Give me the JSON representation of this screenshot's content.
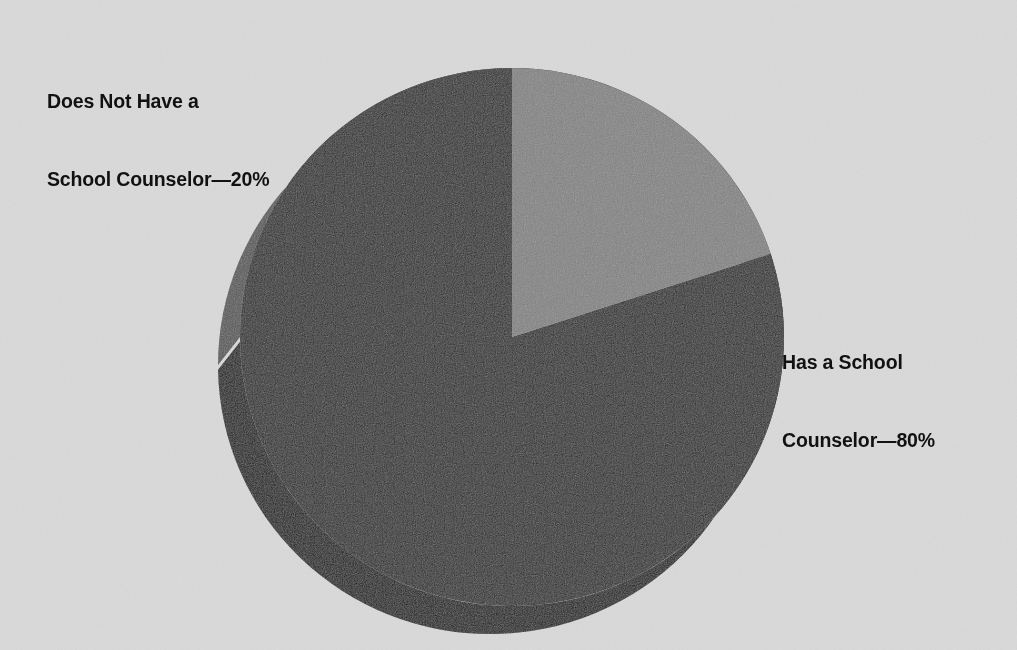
{
  "figure": {
    "background_color": "#dadada",
    "width": 1017,
    "height": 650
  },
  "labels": {
    "left": {
      "name": "does-not-have-counselor-label",
      "line1": "Does Not Have a",
      "line2": "School Counselor—20%",
      "text_color": "#111111"
    },
    "right": {
      "name": "has-counselor-label",
      "line1": "Has a School",
      "line2": "Counselor—80%",
      "text_color": "#111111"
    }
  },
  "chart_data": {
    "type": "pie",
    "title": "",
    "subtitle": "",
    "xlabel": "",
    "ylabel": "",
    "grid": false,
    "legend": "none",
    "three_d": true,
    "start_angle_deg": 90,
    "direction": "counterclockwise",
    "units": "percent",
    "total": 100,
    "labels": [
      "Has a School Counselor—80%",
      "Does Not Have a School Counselor—20%"
    ],
    "categories": [
      "Has a School Counselor",
      "Does Not Have a School Counselor"
    ],
    "values": [
      80,
      20
    ],
    "value_labels": [
      "80%",
      "20%"
    ],
    "slices": [
      {
        "name": "has-school-counselor",
        "label": "Has a School Counselor",
        "value": 80,
        "value_label": "80%",
        "top_color": "#262626",
        "side_color": "#0d0d0d",
        "label_position": "right"
      },
      {
        "name": "does-not-have-school-counselor",
        "label": "Does Not Have a School Counselor",
        "value": 20,
        "value_label": "20%",
        "top_color": "#7f7f7f",
        "side_color": "#535353",
        "label_position": "upper-left"
      }
    ],
    "geometry": {
      "center_x": 512,
      "center_y": 337,
      "radius_x": 272,
      "radius_y": 269,
      "depth_offset_x": -22,
      "depth_offset_y": 28
    }
  }
}
